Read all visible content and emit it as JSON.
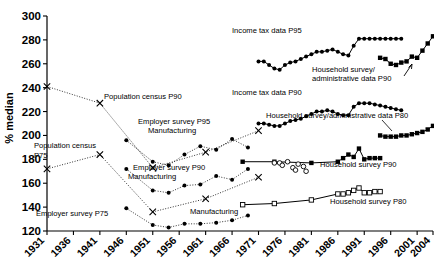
{
  "chart_data": {
    "type": "line",
    "title": "",
    "xlabel": "",
    "ylabel": "% median",
    "xlim": [
      1931,
      2004
    ],
    "ylim": [
      120,
      300
    ],
    "yticks": [
      120,
      140,
      160,
      180,
      200,
      220,
      240,
      260,
      280,
      300
    ],
    "xticks": [
      1931,
      1936,
      1941,
      1946,
      1951,
      1956,
      1961,
      1966,
      1971,
      1976,
      1981,
      1986,
      1991,
      1996,
      2001,
      2004
    ],
    "grid": false,
    "legend_position": "inline-annotations",
    "series": [
      {
        "name": "Population census P90",
        "marker": "x",
        "line": "dotted",
        "x": [
          1931,
          1941,
          1951,
          1961,
          1971
        ],
        "values": [
          241,
          227,
          173,
          186,
          204
        ]
      },
      {
        "name": "Population census P75",
        "marker": "x",
        "line": "dotted",
        "x": [
          1931,
          1941,
          1951,
          1961,
          1971
        ],
        "values": [
          172,
          184,
          136,
          147,
          165
        ]
      },
      {
        "name": "Employer survey P95 Manufacturing",
        "marker": "dot",
        "line": "dotted",
        "x": [
          1946,
          1951,
          1954,
          1957,
          1960,
          1963,
          1966,
          1969
        ],
        "values": [
          196,
          178,
          175,
          184,
          191,
          188,
          197,
          190
        ]
      },
      {
        "name": "Employer survey P90 Manufacturing",
        "marker": "dot",
        "line": "dotted",
        "x": [
          1946,
          1951,
          1954,
          1957,
          1960,
          1963,
          1966,
          1969
        ],
        "values": [
          172,
          154,
          152,
          158,
          159,
          166,
          163,
          172
        ]
      },
      {
        "name": "Employer survey P75 Manufacturing",
        "marker": "dot",
        "line": "dotted",
        "x": [
          1946,
          1951,
          1954,
          1957,
          1960,
          1963,
          1966,
          1969
        ],
        "values": [
          139,
          125,
          123,
          126,
          126,
          127,
          129,
          133
        ]
      },
      {
        "name": "Income tax data P95",
        "marker": "dot",
        "line": "solid-dense",
        "x": [
          1971,
          1972,
          1973,
          1974,
          1975,
          1976,
          1977,
          1978,
          1979,
          1980,
          1981,
          1982,
          1983,
          1984,
          1985,
          1986,
          1987,
          1988,
          1989,
          1990,
          1991,
          1992,
          1993,
          1994,
          1995,
          1996,
          1997,
          1998
        ],
        "values": [
          262,
          262,
          259,
          256,
          255,
          259,
          261,
          262,
          264,
          266,
          268,
          270,
          270,
          271,
          272,
          270,
          268,
          267,
          275,
          281,
          281,
          281,
          281,
          281,
          281,
          281,
          281,
          281
        ]
      },
      {
        "name": "Household survey/administrative data P90",
        "marker": "square",
        "line": "solid-dense",
        "x": [
          1994,
          1995,
          1996,
          1997,
          1998,
          1999,
          2000,
          2001,
          2002,
          2003,
          2004
        ],
        "values": [
          265,
          264,
          260,
          259,
          261,
          262,
          266,
          265,
          271,
          277,
          283
        ]
      },
      {
        "name": "Income tax data P90",
        "marker": "dot",
        "line": "solid-dense",
        "x": [
          1971,
          1972,
          1973,
          1974,
          1975,
          1976,
          1977,
          1978,
          1979,
          1980,
          1981,
          1982,
          1983,
          1984,
          1985,
          1986,
          1987,
          1988,
          1989,
          1990,
          1991,
          1992,
          1993,
          1994,
          1995,
          1996,
          1997,
          1998
        ],
        "values": [
          210,
          210,
          209,
          208,
          208,
          210,
          212,
          213,
          214,
          216,
          218,
          220,
          220,
          221,
          220,
          218,
          217,
          217,
          224,
          227,
          227,
          227,
          226,
          225,
          224,
          223,
          222,
          221
        ]
      },
      {
        "name": "Household survey/administrative data P80",
        "marker": "square",
        "line": "solid-dense",
        "x": [
          1994,
          1995,
          1996,
          1997,
          1998,
          1999,
          2000,
          2001,
          2002,
          2003,
          2004
        ],
        "values": [
          200,
          199,
          199,
          199,
          200,
          200,
          201,
          202,
          203,
          205,
          208
        ]
      },
      {
        "name": "Household survey P90",
        "marker": "square-filled",
        "line": "solid",
        "x": [
          1968,
          1974,
          1981,
          1986,
          1987,
          1988,
          1989,
          1990,
          1991,
          1992,
          1993,
          1994
        ],
        "values": [
          178,
          178,
          177,
          178,
          181,
          184,
          182,
          189,
          180,
          181,
          181,
          181
        ]
      },
      {
        "name": "Household survey P80",
        "marker": "square-open",
        "line": "solid",
        "x": [
          1968,
          1974,
          1981,
          1986,
          1987,
          1988,
          1989,
          1990,
          1991,
          1992,
          1993,
          1994
        ],
        "values": [
          142,
          143,
          146,
          151,
          151,
          152,
          154,
          156,
          152,
          152,
          153,
          153
        ]
      },
      {
        "name": "unlabelled open circles",
        "marker": "circle-open",
        "line": "none",
        "x": [
          1974,
          1975,
          1975.5,
          1976.5,
          1977.5,
          1978,
          1978.5,
          1979.5,
          1980
        ],
        "values": [
          177,
          177,
          175,
          178,
          173,
          171,
          176,
          174,
          170
        ]
      }
    ],
    "annotations": [
      {
        "id": "ann-income-tax-p95",
        "text": "Income tax data P95"
      },
      {
        "id": "ann-household-admin-p90",
        "text": "Household survey/"
      },
      {
        "id": "ann-household-admin-p90b",
        "text": "administrative data P90"
      },
      {
        "id": "ann-income-tax-p90",
        "text": "Income tax data P90"
      },
      {
        "id": "ann-household-admin-p80",
        "text": "Household survey/administrative data P80"
      },
      {
        "id": "ann-population-census-p90",
        "text": "Population census P90"
      },
      {
        "id": "ann-employer-p95",
        "text": "Employer survey P95"
      },
      {
        "id": "ann-employer-p95b",
        "text": "Manufacturing"
      },
      {
        "id": "ann-population-census-p75",
        "text": "Population census"
      },
      {
        "id": "ann-population-census-p75b",
        "text": "P75"
      },
      {
        "id": "ann-employer-p90",
        "text": "Employer survey P90"
      },
      {
        "id": "ann-employer-p90b",
        "text": "Manufacturing"
      },
      {
        "id": "ann-employer-p75",
        "text": "Employer survey P75"
      },
      {
        "id": "ann-manufacturing",
        "text": "Manufacturing"
      },
      {
        "id": "ann-household-p90",
        "text": "Household survey P90"
      },
      {
        "id": "ann-household-p80",
        "text": "Household survey P80"
      }
    ]
  }
}
